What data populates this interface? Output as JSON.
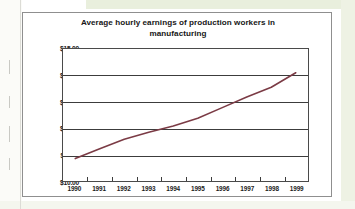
{
  "page": {
    "background_color": "#ffffff",
    "scan_tint_color": "#e9efdd"
  },
  "chart_card": {
    "border_color": "#8f8f8f",
    "background_color": "#ffffff"
  },
  "chart_data": {
    "type": "line",
    "title": "Average hourly earnings of production workers in manufacturing",
    "title_line_1": "Average hourly earnings of production workers in",
    "title_line_2": "manufacturing",
    "xlabel": "",
    "ylabel": "",
    "categories": [
      "1990",
      "1991",
      "1992",
      "1993",
      "1994",
      "1995",
      "1996",
      "1997",
      "1998",
      "1999"
    ],
    "x": [
      1990,
      1991,
      1992,
      1993,
      1994,
      1995,
      1996,
      1997,
      1998,
      1999
    ],
    "values": [
      10.85,
      11.22,
      11.58,
      11.85,
      12.08,
      12.38,
      12.78,
      13.18,
      13.55,
      14.1
    ],
    "series": [
      {
        "name": "Average hourly earnings",
        "color": "#7b3b45",
        "values": [
          10.85,
          11.22,
          11.58,
          11.85,
          12.08,
          12.38,
          12.78,
          13.18,
          13.55,
          14.1
        ]
      }
    ],
    "ylim": [
      10.0,
      15.0
    ],
    "ytick_values": [
      10.0,
      11.0,
      12.0,
      13.0,
      14.0,
      15.0
    ],
    "ytick_labels": [
      "$10.00",
      "$11.00",
      "$12.00",
      "$13.00",
      "$14.00",
      "$15.00"
    ],
    "grid": true,
    "grid_axis": "y",
    "grid_color": "#3c3c3c",
    "legend": false,
    "legend_position": "none",
    "line_color": "#7b3b45",
    "axis_color": "#4a4a4a"
  }
}
